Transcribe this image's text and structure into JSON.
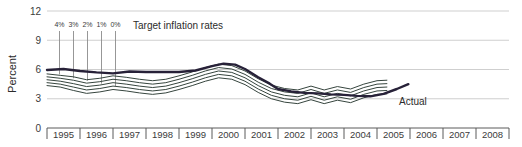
{
  "chart_data": {
    "type": "line",
    "title": "",
    "xlabel": "",
    "ylabel": "Percent",
    "ylim": [
      0,
      12
    ],
    "yticks": [
      0,
      3,
      6,
      9,
      12
    ],
    "ytick_labels": [
      "0",
      "3",
      "6",
      "9",
      "12"
    ],
    "grid": true,
    "legend_position": "inline-annotations",
    "categories": [
      "1995",
      "1996",
      "1997",
      "1998",
      "1999",
      "2000",
      "2001",
      "2002",
      "2003",
      "2004",
      "2005",
      "2006",
      "2007",
      "2008"
    ],
    "xlim": [
      1995,
      2009
    ],
    "annotations": [
      {
        "text": "Target inflation rates",
        "x": 133,
        "y": 29
      },
      {
        "text": "Actual",
        "x": 399,
        "y": 105
      }
    ],
    "target_rate_labels": [
      "4%",
      "3%",
      "2%",
      "1%",
      "0%"
    ],
    "series": [
      {
        "name": "Actual",
        "color": "#272138",
        "width": 2.4,
        "x": [
          1995.0,
          1995.5,
          1996.0,
          1996.5,
          1997.0,
          1997.5,
          1998.0,
          1998.5,
          1999.0,
          1999.5,
          2000.0,
          2000.35,
          2000.7,
          2001.0,
          2001.4,
          2001.75,
          2002.0,
          2002.4,
          2002.8,
          2003.2,
          2003.6,
          2004.0,
          2004.4,
          2004.8,
          2005.2,
          2005.6,
          2005.95
        ],
        "values": [
          5.95,
          6.05,
          5.85,
          5.7,
          5.6,
          5.8,
          5.75,
          5.75,
          5.75,
          5.9,
          6.35,
          6.6,
          6.5,
          6.05,
          5.2,
          4.55,
          4.0,
          3.75,
          3.6,
          3.55,
          3.45,
          3.4,
          3.3,
          3.25,
          3.5,
          4.0,
          4.5
        ]
      },
      {
        "name": "fan-upper-4pct",
        "color": "#36453e",
        "width": 1.0,
        "x": [
          1995.0,
          1995.4,
          1995.8,
          1996.2,
          1996.6,
          1997.0,
          1997.4,
          1997.8,
          1998.2,
          1998.6,
          1999.0,
          1999.4,
          1999.8,
          2000.2,
          2000.6,
          2001.0,
          2001.4,
          2001.8,
          2002.2,
          2002.6,
          2003.0,
          2003.4,
          2003.8,
          2004.2,
          2004.6,
          2005.0,
          2005.3
        ],
        "values": [
          5.55,
          5.4,
          5.25,
          4.95,
          5.1,
          5.35,
          5.2,
          5.0,
          4.85,
          5.0,
          5.35,
          5.75,
          6.2,
          6.55,
          6.4,
          5.85,
          5.05,
          4.4,
          4.05,
          3.9,
          4.3,
          3.9,
          4.25,
          4.0,
          4.5,
          4.85,
          4.9
        ]
      },
      {
        "name": "fan-3pct",
        "color": "#36453e",
        "width": 1.0,
        "x": [
          1995.0,
          1995.4,
          1995.8,
          1996.2,
          1996.6,
          1997.0,
          1997.4,
          1997.8,
          1998.2,
          1998.6,
          1999.0,
          1999.4,
          1999.8,
          2000.2,
          2000.6,
          2001.0,
          2001.4,
          2001.8,
          2002.2,
          2002.6,
          2003.0,
          2003.4,
          2003.8,
          2004.2,
          2004.6,
          2005.0,
          2005.3
        ],
        "values": [
          5.25,
          5.1,
          4.9,
          4.6,
          4.75,
          5.0,
          4.85,
          4.65,
          4.5,
          4.65,
          5.0,
          5.4,
          5.85,
          6.2,
          6.05,
          5.5,
          4.7,
          4.05,
          3.7,
          3.55,
          3.95,
          3.55,
          3.9,
          3.65,
          4.15,
          4.5,
          4.55
        ]
      },
      {
        "name": "fan-2pct",
        "color": "#36453e",
        "width": 1.0,
        "x": [
          1995.0,
          1995.4,
          1995.8,
          1996.2,
          1996.6,
          1997.0,
          1997.4,
          1997.8,
          1998.2,
          1998.6,
          1999.0,
          1999.4,
          1999.8,
          2000.2,
          2000.6,
          2001.0,
          2001.4,
          2001.8,
          2002.2,
          2002.6,
          2003.0,
          2003.4,
          2003.8,
          2004.2,
          2004.6,
          2005.0,
          2005.3
        ],
        "values": [
          4.95,
          4.8,
          4.55,
          4.25,
          4.4,
          4.65,
          4.5,
          4.3,
          4.15,
          4.3,
          4.65,
          5.05,
          5.5,
          5.85,
          5.7,
          5.15,
          4.35,
          3.7,
          3.35,
          3.2,
          3.6,
          3.2,
          3.55,
          3.3,
          3.8,
          4.15,
          4.2
        ]
      },
      {
        "name": "fan-1pct",
        "color": "#36453e",
        "width": 1.0,
        "x": [
          1995.0,
          1995.4,
          1995.8,
          1996.2,
          1996.6,
          1997.0,
          1997.4,
          1997.8,
          1998.2,
          1998.6,
          1999.0,
          1999.4,
          1999.8,
          2000.2,
          2000.6,
          2001.0,
          2001.4,
          2001.8,
          2002.2,
          2002.6,
          2003.0,
          2003.4,
          2003.8,
          2004.2,
          2004.6,
          2005.0,
          2005.3
        ],
        "values": [
          4.65,
          4.5,
          4.2,
          3.9,
          4.05,
          4.3,
          4.15,
          3.95,
          3.8,
          3.95,
          4.3,
          4.7,
          5.15,
          5.5,
          5.35,
          4.8,
          4.0,
          3.35,
          3.0,
          2.85,
          3.25,
          2.85,
          3.2,
          2.95,
          3.45,
          3.8,
          3.85
        ]
      },
      {
        "name": "fan-lower-0pct",
        "color": "#36453e",
        "width": 1.0,
        "x": [
          1995.0,
          1995.4,
          1995.8,
          1996.2,
          1996.6,
          1997.0,
          1997.4,
          1997.8,
          1998.2,
          1998.6,
          1999.0,
          1999.4,
          1999.8,
          2000.2,
          2000.6,
          2001.0,
          2001.4,
          2001.8,
          2002.2,
          2002.6,
          2003.0,
          2003.4,
          2003.8,
          2004.2,
          2004.6,
          2005.0,
          2005.3
        ],
        "values": [
          4.35,
          4.2,
          3.85,
          3.55,
          3.7,
          3.95,
          3.8,
          3.6,
          3.45,
          3.6,
          3.95,
          4.35,
          4.8,
          5.15,
          5.0,
          4.45,
          3.65,
          3.0,
          2.65,
          2.5,
          2.9,
          2.5,
          2.85,
          2.6,
          3.1,
          3.45,
          3.5
        ]
      }
    ]
  },
  "colors": {
    "actual_line": "#272138",
    "fan_line": "#36453e",
    "gridline": "#c9c9c9",
    "axis": "#7a7a7a",
    "text": "#3b3b3b",
    "background": "#ffffff"
  }
}
